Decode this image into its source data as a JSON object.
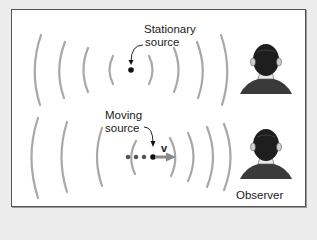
{
  "diagram": {
    "top_panel": {
      "label_line1": "Stationary",
      "label_line2": "source"
    },
    "bottom_panel": {
      "label_line1": "Moving",
      "label_line2": "source",
      "velocity_label": "v"
    },
    "observer_label": "Observer",
    "colors": {
      "background": "#ececec",
      "frame_fill": "#ffffff",
      "frame_border": "#555555",
      "wavefront": "#a8a8a8",
      "source_dot": "#111111",
      "trail_dot": "#555555",
      "velocity_arrow": "#8a8a8a",
      "text": "#1a1a1a"
    },
    "icons": [
      "wavefront-arc",
      "source-dot",
      "velocity-arrow",
      "observer-head"
    ]
  }
}
